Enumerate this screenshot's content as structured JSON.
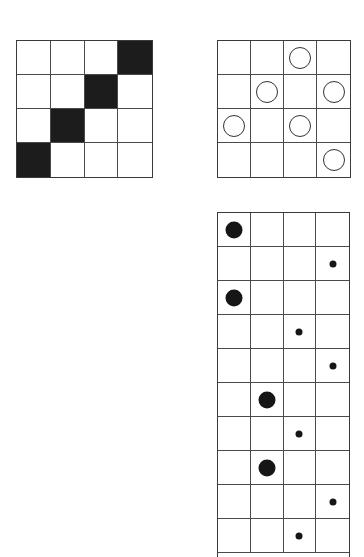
{
  "figures": [
    {
      "id": "grid-a",
      "description": "4x4 grid with filled black squares on anti-diagonal",
      "rows": 4,
      "cols": 4,
      "filled_cells": [
        [
          0,
          3
        ],
        [
          1,
          2
        ],
        [
          2,
          1
        ],
        [
          3,
          0
        ]
      ],
      "fill_color": "#1c1c1c"
    },
    {
      "id": "grid-b",
      "description": "4x4 grid with hollow circles",
      "rows": 4,
      "cols": 4,
      "ring_cells": [
        [
          0,
          2
        ],
        [
          1,
          1
        ],
        [
          1,
          3
        ],
        [
          2,
          0
        ],
        [
          2,
          2
        ],
        [
          3,
          3
        ]
      ]
    },
    {
      "id": "grid-c",
      "description": "4-column grid with large and small dots",
      "rows": 10,
      "cols": 4,
      "dots": [
        {
          "row": 0,
          "col": 0,
          "size": "big"
        },
        {
          "row": 1,
          "col": 3,
          "size": "small"
        },
        {
          "row": 2,
          "col": 0,
          "size": "big"
        },
        {
          "row": 3,
          "col": 2,
          "size": "small"
        },
        {
          "row": 4,
          "col": 3,
          "size": "small"
        },
        {
          "row": 5,
          "col": 1,
          "size": "big"
        },
        {
          "row": 6,
          "col": 2,
          "size": "small"
        },
        {
          "row": 7,
          "col": 1,
          "size": "big"
        },
        {
          "row": 8,
          "col": 3,
          "size": "small"
        },
        {
          "row": 9,
          "col": 2,
          "size": "small"
        }
      ]
    }
  ]
}
